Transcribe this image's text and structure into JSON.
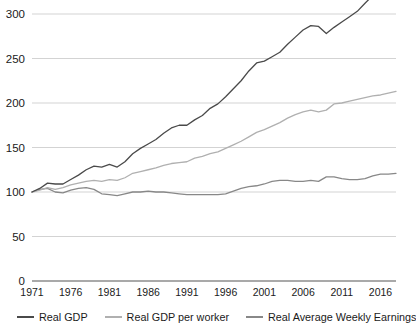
{
  "chart_data": {
    "type": "line",
    "title": "",
    "xlabel": "",
    "ylabel": "",
    "xlim": [
      1971,
      2018
    ],
    "ylim": [
      0,
      300
    ],
    "grid": true,
    "legend_position": "bottom",
    "y_ticks": [
      0,
      50,
      100,
      150,
      200,
      250,
      300
    ],
    "x_ticks": [
      1971,
      1976,
      1981,
      1986,
      1991,
      1996,
      2001,
      2006,
      2011,
      2016
    ],
    "x": [
      1971,
      1972,
      1973,
      1974,
      1975,
      1976,
      1977,
      1978,
      1979,
      1980,
      1981,
      1982,
      1983,
      1984,
      1985,
      1986,
      1987,
      1988,
      1989,
      1990,
      1991,
      1992,
      1993,
      1994,
      1995,
      1996,
      1997,
      1998,
      1999,
      2000,
      2001,
      2002,
      2003,
      2004,
      2005,
      2006,
      2007,
      2008,
      2009,
      2010,
      2011,
      2012,
      2013,
      2014,
      2015,
      2016,
      2017,
      2018
    ],
    "series": [
      {
        "name": "Real GDP",
        "color": "#4a4a4a",
        "values": [
          100,
          104,
          110,
          109,
          109,
          114,
          119,
          125,
          129,
          128,
          131,
          128,
          134,
          143,
          149,
          154,
          159,
          166,
          172,
          175,
          175,
          181,
          186,
          194,
          199,
          207,
          216,
          225,
          236,
          245,
          247,
          252,
          257,
          266,
          274,
          282,
          287,
          286,
          278,
          285,
          291,
          297,
          303,
          312,
          321,
          327,
          336,
          347
        ]
      },
      {
        "name": "Real GDP per worker",
        "color": "#b0b0b0",
        "values": [
          100,
          102,
          105,
          103,
          105,
          108,
          110,
          112,
          113,
          112,
          114,
          113,
          116,
          121,
          123,
          125,
          127,
          130,
          132,
          133,
          134,
          138,
          140,
          143,
          145,
          149,
          153,
          157,
          162,
          167,
          170,
          174,
          178,
          183,
          187,
          190,
          192,
          190,
          192,
          199,
          200,
          202,
          204,
          206,
          208,
          209,
          211,
          213
        ]
      },
      {
        "name": "Real Average Weekly Earnings",
        "color": "#888888",
        "values": [
          100,
          103,
          104,
          100,
          99,
          102,
          104,
          105,
          103,
          98,
          97,
          96,
          98,
          100,
          100,
          101,
          100,
          100,
          99,
          98,
          97,
          97,
          97,
          97,
          97,
          98,
          101,
          104,
          106,
          107,
          109,
          112,
          113,
          113,
          112,
          112,
          113,
          112,
          117,
          117,
          115,
          114,
          114,
          115,
          118,
          120,
          120,
          121
        ]
      }
    ]
  },
  "legend": {
    "items": [
      {
        "label": "Real GDP",
        "color": "#4a4a4a"
      },
      {
        "label": "Real GDP per worker",
        "color": "#b0b0b0"
      },
      {
        "label": "Real Average Weekly Earnings",
        "color": "#888888"
      }
    ]
  },
  "axis_colors": {
    "gridline": "#c8c8c8",
    "baseline": "#555555",
    "text": "#1a1a1a"
  }
}
